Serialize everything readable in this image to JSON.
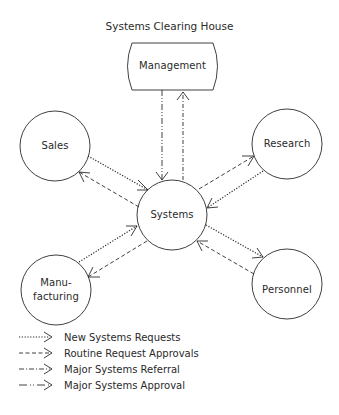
{
  "diagram": {
    "title": "Systems Clearing House",
    "nodes": [
      {
        "id": "management",
        "label": "Management",
        "shape": "rounded-box"
      },
      {
        "id": "sales",
        "label": "Sales",
        "shape": "circle"
      },
      {
        "id": "research",
        "label": "Research",
        "shape": "circle"
      },
      {
        "id": "systems",
        "label": "Systems",
        "shape": "circle"
      },
      {
        "id": "manufacturing",
        "label_line1": "Manu-",
        "label_line2": "facturing",
        "shape": "circle"
      },
      {
        "id": "personnel",
        "label": "Personnel",
        "shape": "circle"
      }
    ],
    "edges": [
      {
        "from": "management",
        "to": "systems",
        "type": "Major Systems Approval"
      },
      {
        "from": "systems",
        "to": "management",
        "type": "Major Systems Referral"
      },
      {
        "from": "sales",
        "to": "systems",
        "type": "New Systems Requests"
      },
      {
        "from": "systems",
        "to": "sales",
        "type": "Routine Request Approvals"
      },
      {
        "from": "systems",
        "to": "research",
        "type": "Routine Request Approvals"
      },
      {
        "from": "research",
        "to": "systems",
        "type": "New Systems Requests"
      },
      {
        "from": "manufacturing",
        "to": "systems",
        "type": "New Systems Requests"
      },
      {
        "from": "systems",
        "to": "manufacturing",
        "type": "Routine Request Approvals"
      },
      {
        "from": "systems",
        "to": "personnel",
        "type": "New Systems Requests"
      },
      {
        "from": "personnel",
        "to": "systems",
        "type": "Routine Request Approvals"
      }
    ],
    "legend": [
      {
        "style": "dotted",
        "label": "New Systems Requests"
      },
      {
        "style": "dashed",
        "label": "Routine Request Approvals"
      },
      {
        "style": "dash-dot",
        "label": "Major Systems Referral"
      },
      {
        "style": "dash-dot-dot",
        "label": "Major Systems Approval"
      }
    ]
  },
  "colors": {
    "line": "#2a2a2a",
    "background": "#ffffff"
  }
}
